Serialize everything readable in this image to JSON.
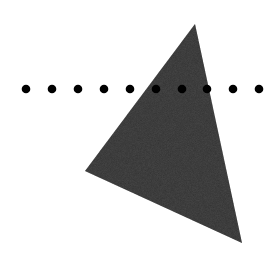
{
  "canvas": {
    "width": 275,
    "height": 256,
    "background": "#ffffff"
  },
  "triangle": {
    "points": [
      [
        195,
        24
      ],
      [
        85,
        171
      ],
      [
        242,
        243
      ]
    ],
    "fill": "#4a4a4a",
    "texture": "noise"
  },
  "dots": {
    "y": 89,
    "radius": 4.3,
    "fill": "#000000",
    "x": [
      26,
      52,
      78,
      104,
      130,
      156,
      182,
      207,
      233,
      259
    ]
  }
}
